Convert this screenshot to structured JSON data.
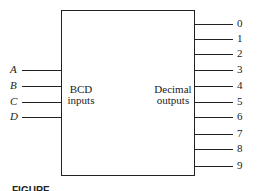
{
  "diagram": {
    "block": {
      "input_group_label": [
        "BCD",
        "inputs"
      ],
      "output_group_label": [
        "Decimal",
        "outputs"
      ]
    },
    "inputs": [
      {
        "label": "A",
        "y": 70
      },
      {
        "label": "B",
        "y": 86
      },
      {
        "label": "C",
        "y": 102
      },
      {
        "label": "D",
        "y": 117
      }
    ],
    "outputs": [
      {
        "label": "0",
        "y": 24
      },
      {
        "label": "1",
        "y": 39
      },
      {
        "label": "2",
        "y": 54
      },
      {
        "label": "3",
        "y": 70
      },
      {
        "label": "4",
        "y": 86
      },
      {
        "label": "5",
        "y": 102
      },
      {
        "label": "6",
        "y": 117
      },
      {
        "label": "7",
        "y": 134
      },
      {
        "label": "8",
        "y": 149
      },
      {
        "label": "9",
        "y": 166
      }
    ],
    "caption": "FIGURE"
  }
}
